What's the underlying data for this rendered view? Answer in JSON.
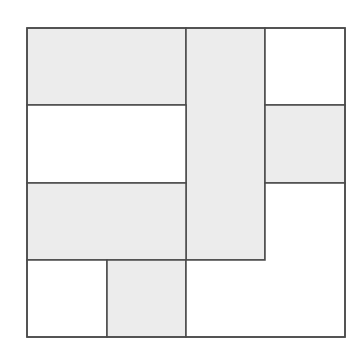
{
  "diagram": {
    "grid": {
      "cols": 4,
      "rows": 4,
      "origin_x": 27,
      "origin_y": 28,
      "cell": 79.5
    },
    "colors": {
      "shaded": "#ececec",
      "unshaded": "#ffffff",
      "stroke": "#4a4a4a"
    },
    "regions": [
      {
        "id": "top-left-bar",
        "shaded": true,
        "cells": [
          [
            0,
            0
          ],
          [
            1,
            0
          ]
        ]
      },
      {
        "id": "tall-center-bar",
        "shaded": true,
        "cells": [
          [
            2,
            0
          ],
          [
            2,
            1
          ],
          [
            2,
            2
          ]
        ]
      },
      {
        "id": "top-right-square",
        "shaded": false,
        "cells": [
          [
            3,
            0
          ]
        ]
      },
      {
        "id": "right-square",
        "shaded": true,
        "cells": [
          [
            3,
            1
          ]
        ]
      },
      {
        "id": "middle-left-bar",
        "shaded": false,
        "cells": [
          [
            0,
            1
          ],
          [
            1,
            1
          ]
        ]
      },
      {
        "id": "lower-left-bar",
        "shaded": true,
        "cells": [
          [
            0,
            2
          ],
          [
            1,
            2
          ]
        ]
      },
      {
        "id": "bottom-left-square",
        "shaded": false,
        "cells": [
          [
            0,
            3
          ]
        ]
      },
      {
        "id": "bottom-square",
        "shaded": true,
        "cells": [
          [
            1,
            3
          ]
        ]
      },
      {
        "id": "bottom-right-l-shape",
        "shaded": false,
        "cells": [
          [
            3,
            2
          ],
          [
            2,
            3
          ],
          [
            3,
            3
          ]
        ]
      }
    ]
  }
}
